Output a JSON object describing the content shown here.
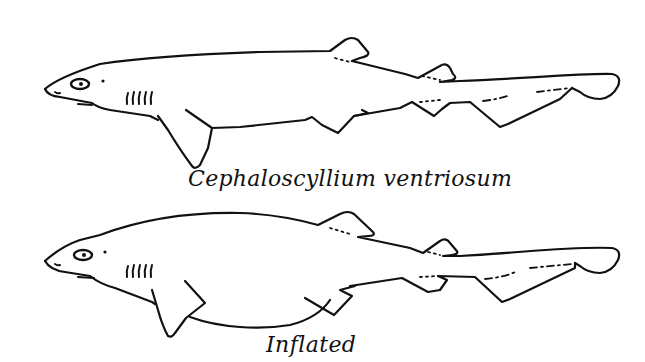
{
  "figure": {
    "panels": [
      {
        "id": "normal",
        "caption": "Cephaloscyllium ventriosum",
        "subject": "shark-normal-side-view"
      },
      {
        "id": "inflated",
        "caption": "Inflated",
        "subject": "shark-inflated-side-view"
      }
    ],
    "colors": {
      "background": "#ffffff",
      "ink": "#111111"
    }
  }
}
